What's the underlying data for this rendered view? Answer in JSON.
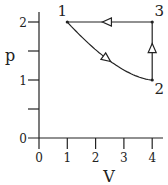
{
  "chart_data": {
    "type": "line",
    "title": "",
    "xlabel": "V",
    "ylabel": "p",
    "xlim": [
      0,
      4
    ],
    "ylim": [
      0,
      2
    ],
    "x_ticks": [
      "0",
      "1",
      "2",
      "3",
      "4"
    ],
    "y_ticks": [
      "0",
      "1",
      "2"
    ],
    "y_minor_ticks": [
      0.5,
      1.5
    ],
    "grid": false,
    "points": [
      {
        "label": "1",
        "V": 1,
        "p": 2
      },
      {
        "label": "2",
        "V": 4,
        "p": 1
      },
      {
        "label": "3",
        "V": 4,
        "p": 2
      }
    ],
    "paths": [
      {
        "name": "1-2",
        "from": "1",
        "to": "2",
        "shape": "curve",
        "direction": "1 to 2"
      },
      {
        "name": "2-3",
        "from": "2",
        "to": "3",
        "shape": "vertical",
        "direction": "2 to 3"
      },
      {
        "name": "3-1",
        "from": "3",
        "to": "1",
        "shape": "horizontal",
        "direction": "3 to 1"
      }
    ]
  }
}
